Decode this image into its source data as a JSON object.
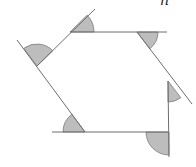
{
  "diagram": {
    "label": "n",
    "colors": {
      "line": "#6e6e6e",
      "sector_fill": "#bdbdbd",
      "sector_stroke": "#7a7a7a",
      "background": "#ffffff"
    },
    "vertices": [
      {
        "name": "top-left",
        "x": 70,
        "y": 32
      },
      {
        "name": "top-right",
        "x": 137,
        "y": 32
      },
      {
        "name": "right",
        "x": 168,
        "y": 81
      },
      {
        "name": "bottom-right",
        "x": 169,
        "y": 132
      },
      {
        "name": "bottom-left",
        "x": 85,
        "y": 132
      },
      {
        "name": "left",
        "x": 37,
        "y": 66
      }
    ],
    "extended_sides": [
      {
        "name": "top-side",
        "from": [
          70,
          32
        ],
        "to": [
          167,
          32
        ]
      },
      {
        "name": "upper-right-side",
        "from": [
          137,
          32
        ],
        "to": [
          192,
          104
        ]
      },
      {
        "name": "right-side",
        "from": [
          168,
          81
        ],
        "to": [
          169,
          157
        ]
      },
      {
        "name": "bottom-side",
        "from": [
          169,
          132
        ],
        "to": [
          52,
          132
        ]
      },
      {
        "name": "lower-left-side",
        "from": [
          85,
          132
        ],
        "to": [
          17,
          40
        ]
      },
      {
        "name": "upper-left-side",
        "from": [
          37,
          66
        ],
        "to": [
          95,
          9
        ]
      }
    ],
    "exterior_angles_count": 6
  }
}
